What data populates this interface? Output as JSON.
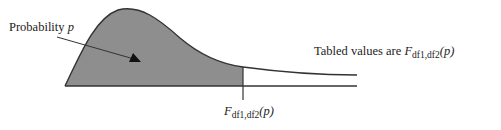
{
  "diagram": {
    "type": "F-distribution density curve with shaded lower-tail area",
    "labels": {
      "probability": {
        "text": "Probability ",
        "var": "p"
      },
      "tabled": {
        "text": "Tabled values are ",
        "func": "F",
        "sub": "df1,df2",
        "arg": "(p)"
      },
      "critical": {
        "func": "F",
        "sub": "df1,df2",
        "arg": "(p)"
      }
    },
    "colors": {
      "shade": "#8e8e8e",
      "line": "#333333",
      "text": "#222222"
    }
  }
}
